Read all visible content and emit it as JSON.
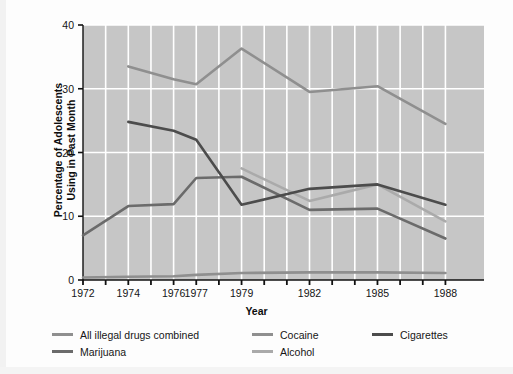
{
  "chart_data": {
    "type": "line",
    "title": "",
    "xlabel": "Year",
    "ylabel": "Percentage of Adolescents Using in Past Month",
    "ylabel_line1": "Percentage of Adolescents",
    "ylabel_line2": "Using in Past Month",
    "ylim": [
      0,
      40
    ],
    "yticks": [
      0,
      10,
      20,
      30,
      40
    ],
    "ytick_labels": [
      "0",
      "10",
      "20",
      "30",
      "40"
    ],
    "grid": true,
    "grid_color": "#ffffff",
    "plot_background": "#c6c6c6",
    "legend_position": "below",
    "categories": [
      1972,
      1973,
      1974,
      1975,
      1976,
      1977,
      1978,
      1979,
      1980,
      1981,
      1982,
      1983,
      1984,
      1985,
      1986,
      1987,
      1988
    ],
    "xtick_labels": [
      "1972",
      "",
      "1974",
      "",
      "1976",
      "1977",
      "",
      "1979",
      "",
      "",
      "1982",
      "",
      "",
      "1985",
      "",
      "",
      "1988"
    ],
    "visible_xtick_labels": [
      "1972",
      "1974",
      "1976",
      "1977",
      "1979",
      "1982",
      "1985",
      "1988"
    ],
    "series": [
      {
        "name": "All illegal drugs combined",
        "color": "#8f8f8f",
        "x": [
          1974,
          1976,
          1977,
          1979,
          1982,
          1985,
          1988
        ],
        "values": [
          33.5,
          31.5,
          30.7,
          36.3,
          29.5,
          30.4,
          24.5
        ]
      },
      {
        "name": "Marijuana",
        "color": "#6b6b6b",
        "x": [
          1972,
          1974,
          1976,
          1977,
          1979,
          1982,
          1985,
          1988
        ],
        "values": [
          7.0,
          11.6,
          11.9,
          16.0,
          16.2,
          11.0,
          11.2,
          6.5
        ]
      },
      {
        "name": "Cocaine",
        "color": "#8f8f8f",
        "x": [
          1972,
          1974,
          1976,
          1977,
          1979,
          1982,
          1985,
          1988
        ],
        "values": [
          0.4,
          0.5,
          0.6,
          0.8,
          1.1,
          1.2,
          1.2,
          1.1
        ]
      },
      {
        "name": "Alcohol",
        "color": "#aaaaaa",
        "x": [
          1979,
          1982,
          1985,
          1988
        ],
        "values": [
          17.5,
          12.4,
          15.0,
          9.2
        ]
      },
      {
        "name": "Cigarettes",
        "color": "#4c4c4c",
        "x": [
          1974,
          1976,
          1977,
          1979,
          1982,
          1985,
          1988
        ],
        "values": [
          24.8,
          23.4,
          22.0,
          11.8,
          14.3,
          15.0,
          11.8
        ]
      }
    ]
  },
  "axis": {
    "x_title": "Year",
    "y_title_line1": "Percentage of Adolescents",
    "y_title_line2": "Using in Past Month"
  },
  "legend": {
    "items": [
      {
        "label": "All illegal drugs combined",
        "color": "#8f8f8f",
        "col": 0,
        "row": 0
      },
      {
        "label": "Marijuana",
        "color": "#6b6b6b",
        "col": 0,
        "row": 1
      },
      {
        "label": "Cocaine",
        "color": "#8f8f8f",
        "col": 1,
        "row": 0
      },
      {
        "label": "Alcohol",
        "color": "#aaaaaa",
        "col": 1,
        "row": 1
      },
      {
        "label": "Cigarettes",
        "color": "#4c4c4c",
        "col": 2,
        "row": 0
      }
    ]
  }
}
